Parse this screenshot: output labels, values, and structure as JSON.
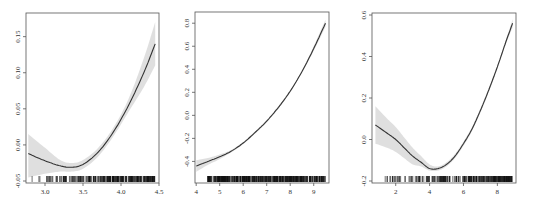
{
  "chart_data": [
    {
      "type": "line",
      "title": "",
      "xlabel": "",
      "ylabel": "",
      "xlim": [
        2.75,
        4.5
      ],
      "ylim": [
        -0.05,
        0.18
      ],
      "xticks": [
        3.0,
        3.5,
        4.0,
        4.5
      ],
      "xtick_labels": [
        "3.0",
        "3.5",
        "4.0",
        "4.5"
      ],
      "yticks": [
        -0.05,
        0.0,
        0.05,
        0.1,
        0.15
      ],
      "ytick_labels": [
        "-0.05",
        "0.00",
        "0.05",
        "0.10",
        "0.15"
      ],
      "grid": false,
      "legend": null,
      "series": [
        {
          "name": "fit",
          "x": [
            2.78,
            3.0,
            3.2,
            3.35,
            3.5,
            3.7,
            3.9,
            4.1,
            4.3,
            4.45
          ],
          "y": [
            -0.012,
            -0.022,
            -0.029,
            -0.031,
            -0.027,
            -0.01,
            0.018,
            0.055,
            0.1,
            0.14
          ],
          "lower": [
            -0.045,
            -0.04,
            -0.037,
            -0.037,
            -0.033,
            -0.016,
            0.012,
            0.046,
            0.08,
            0.11
          ],
          "upper": [
            0.015,
            -0.004,
            -0.021,
            -0.025,
            -0.021,
            -0.004,
            0.024,
            0.064,
            0.12,
            0.17
          ]
        }
      ],
      "rug": {
        "x_from": 2.78,
        "x_to": 4.45,
        "density": "sparse-to-dense"
      }
    },
    {
      "type": "line",
      "title": "",
      "xlabel": "",
      "ylabel": "",
      "xlim": [
        3.95,
        9.65
      ],
      "ylim": [
        -0.57,
        0.88
      ],
      "xticks": [
        4,
        5,
        6,
        7,
        8,
        9
      ],
      "xtick_labels": [
        "4",
        "5",
        "6",
        "7",
        "8",
        "9"
      ],
      "yticks": [
        -0.4,
        -0.2,
        0.0,
        0.2,
        0.4,
        0.6,
        0.8
      ],
      "ytick_labels": [
        "-0.4",
        "-0.2",
        "0.0",
        "0.2",
        "0.4",
        "0.6",
        "0.8"
      ],
      "grid": false,
      "legend": null,
      "series": [
        {
          "name": "fit",
          "x": [
            4.0,
            4.5,
            5.0,
            5.5,
            6.0,
            6.5,
            7.0,
            7.5,
            8.0,
            8.5,
            9.0,
            9.5
          ],
          "y": [
            -0.44,
            -0.4,
            -0.36,
            -0.31,
            -0.24,
            -0.15,
            -0.05,
            0.07,
            0.21,
            0.38,
            0.58,
            0.8
          ],
          "lower": [
            -0.49,
            -0.43,
            -0.38,
            -0.32,
            -0.25,
            -0.16,
            -0.06,
            0.06,
            0.2,
            0.37,
            0.56,
            0.77
          ],
          "upper": [
            -0.39,
            -0.37,
            -0.34,
            -0.3,
            -0.23,
            -0.14,
            -0.04,
            0.08,
            0.22,
            0.39,
            0.6,
            0.83
          ]
        }
      ],
      "rug": {
        "x_from": 4.5,
        "x_to": 9.5,
        "density": "dense"
      }
    },
    {
      "type": "line",
      "title": "",
      "xlabel": "",
      "ylabel": "",
      "xlim": [
        0.6,
        9.1
      ],
      "ylim": [
        -0.2,
        0.6
      ],
      "xticks": [
        2,
        4,
        6,
        8
      ],
      "xtick_labels": [
        "2",
        "4",
        "6",
        "8"
      ],
      "yticks": [
        -0.2,
        0.0,
        0.2,
        0.4,
        0.6
      ],
      "ytick_labels": [
        "-0.2",
        "0.0",
        "0.2",
        "0.4",
        "0.6"
      ],
      "grid": false,
      "legend": null,
      "series": [
        {
          "name": "fit",
          "x": [
            0.8,
            1.5,
            2.0,
            2.5,
            3.0,
            3.5,
            4.0,
            4.5,
            5.0,
            5.5,
            6.0,
            6.5,
            7.0,
            7.5,
            8.0,
            8.5,
            8.9
          ],
          "y": [
            0.07,
            0.03,
            0.0,
            -0.04,
            -0.08,
            -0.11,
            -0.14,
            -0.14,
            -0.12,
            -0.08,
            -0.02,
            0.05,
            0.14,
            0.24,
            0.35,
            0.47,
            0.56
          ],
          "lower": [
            -0.02,
            -0.04,
            -0.06,
            -0.09,
            -0.12,
            -0.13,
            -0.15,
            -0.15,
            -0.13,
            -0.09,
            -0.03,
            0.04,
            0.13,
            0.23,
            0.34,
            0.46,
            0.54
          ],
          "upper": [
            0.16,
            0.1,
            0.06,
            0.01,
            -0.04,
            -0.08,
            -0.12,
            -0.13,
            -0.11,
            -0.07,
            -0.01,
            0.06,
            0.15,
            0.25,
            0.36,
            0.48,
            0.58
          ]
        }
      ],
      "rug": {
        "x_from": 0.8,
        "x_to": 8.9,
        "density": "sparse-to-dense"
      }
    }
  ],
  "panels": [
    {
      "frame": {
        "left": 26,
        "top": 13,
        "right": 159,
        "bottom": 183
      }
    },
    {
      "frame": {
        "left": 195,
        "top": 12,
        "right": 329,
        "bottom": 183
      }
    },
    {
      "frame": {
        "left": 372,
        "top": 13,
        "right": 516,
        "bottom": 183
      }
    }
  ]
}
